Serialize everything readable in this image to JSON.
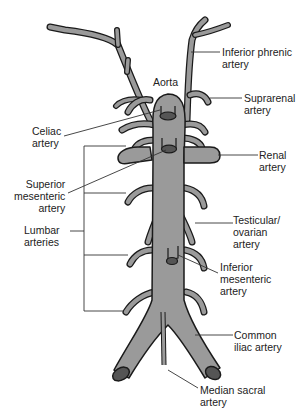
{
  "diagram": {
    "type": "anatomical-illustration",
    "colors": {
      "vessel_fill": "#9a9a9a",
      "vessel_outline": "#1a1a1a",
      "lumen_fill": "#555555",
      "leader_line": "#333333",
      "text": "#222222",
      "background": "#ffffff"
    },
    "labels": {
      "aorta": "Aorta",
      "inferior_phrenic": "Inferior phrenic\nartery",
      "suprarenal": "Suprarenal\nartery",
      "celiac": "Celiac\nartery",
      "renal": "Renal\nartery",
      "superior_mesenteric": "Superior\nmesenteric\nartery",
      "testicular_ovarian": "Testicular/\novarian\nartery",
      "lumbar": "Lumbar\narteries",
      "inferior_mesenteric": "Inferior\nmesenteric\nartery",
      "common_iliac": "Common\niliac artery",
      "median_sacral": "Median sacral\nartery"
    }
  }
}
